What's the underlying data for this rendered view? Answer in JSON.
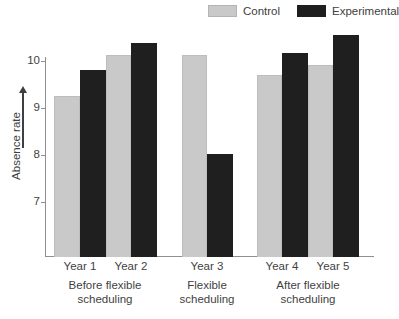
{
  "chart_data": {
    "type": "bar",
    "title": "",
    "xlabel": "",
    "ylabel": "Absence rate",
    "ylim": [
      6.3,
      10.8
    ],
    "yticks": [
      7,
      8,
      9,
      10
    ],
    "ytick_labels": [
      "7",
      "8",
      "9",
      "10"
    ],
    "grid": false,
    "legend_position": "top-right",
    "categories": [
      "Year 1",
      "Year 2",
      "Year 3",
      "Year 4",
      "Year 5"
    ],
    "series": [
      {
        "name": "Control",
        "color": "#c9c9c9",
        "values": [
          9.25,
          10.12,
          10.12,
          9.7,
          9.92
        ]
      },
      {
        "name": "Experimental",
        "color": "#1f1f1f",
        "values": [
          9.8,
          10.38,
          8.03,
          10.17,
          10.55
        ]
      }
    ],
    "group_annotations": [
      {
        "line1": "Before flexible",
        "line2": "scheduling",
        "categories": [
          "Year 1",
          "Year 2"
        ]
      },
      {
        "line1": "Flexible",
        "line2": "scheduling",
        "categories": [
          "Year 3"
        ]
      },
      {
        "line1": "After flexible",
        "line2": "scheduling",
        "categories": [
          "Year 4",
          "Year 5"
        ]
      }
    ]
  },
  "legend": {
    "items": [
      {
        "label": "Control",
        "swatch": "gray-square-swatch"
      },
      {
        "label": "Experimental",
        "swatch": "black-square-swatch"
      }
    ]
  },
  "axis": {
    "y_title": "Absence rate",
    "y_arrow": "up-arrow-icon",
    "tick_labels": [
      "10",
      "9",
      "8",
      "7"
    ]
  },
  "x_labels": [
    "Year 1",
    "Year 2",
    "Year 3",
    "Year 4",
    "Year 5"
  ],
  "group_labels": [
    {
      "line1": "Before flexible",
      "line2": "scheduling"
    },
    {
      "line1": "Flexible",
      "line2": "scheduling"
    },
    {
      "line1": "After flexible",
      "line2": "scheduling"
    }
  ]
}
